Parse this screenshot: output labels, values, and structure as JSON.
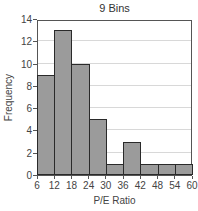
{
  "chart_data": {
    "type": "bar",
    "title": "9 Bins",
    "xlabel": "P/E Ratio",
    "ylabel": "Frequency",
    "bin_edges": [
      6,
      12,
      18,
      24,
      30,
      36,
      42,
      48,
      54,
      60
    ],
    "categories": [
      "6-12",
      "12-18",
      "18-24",
      "24-30",
      "30-36",
      "36-42",
      "42-48",
      "48-54",
      "54-60"
    ],
    "values": [
      9,
      13,
      10,
      5,
      1,
      3,
      1,
      1,
      1
    ],
    "xlim": [
      6,
      60
    ],
    "ylim": [
      0,
      14
    ],
    "x_ticks": [
      "6",
      "12",
      "18",
      "24",
      "30",
      "36",
      "42",
      "48",
      "54",
      "60"
    ],
    "y_ticks": [
      "0",
      "2",
      "4",
      "6",
      "8",
      "10",
      "12",
      "14"
    ],
    "grid": true,
    "legend": null
  },
  "colors": {
    "bar_fill": "#9b9b9b",
    "bar_edge": "#2a2a2a",
    "grid": "#d8d8d8"
  }
}
